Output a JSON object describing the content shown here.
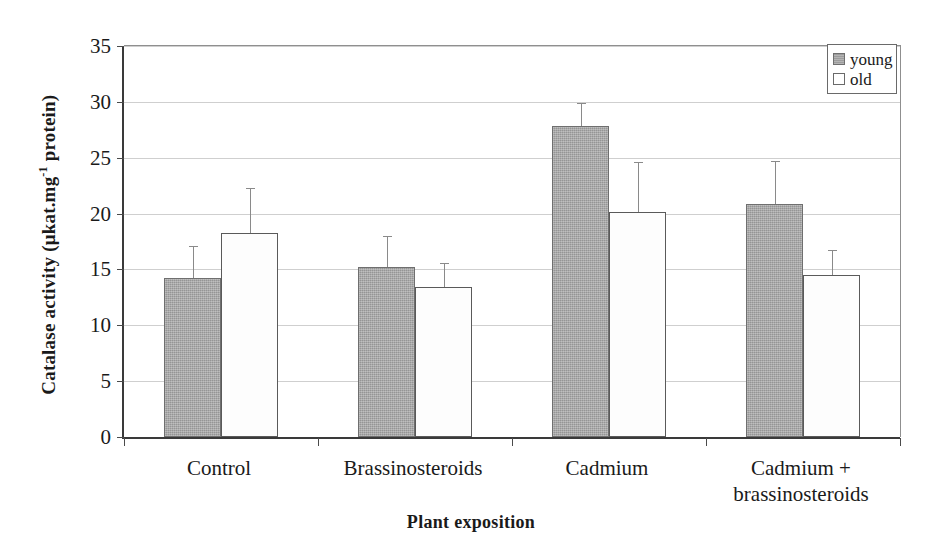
{
  "chart_data": {
    "type": "bar",
    "title": "",
    "xlabel": "Plant exposition",
    "ylabel": "Catalase activity (μkat.mg⁻¹ protein)",
    "ylabel_parts": {
      "prefix": "Catalase activity (μkat.mg",
      "superscript": "-1",
      "suffix": " protein)"
    },
    "categories": [
      "Control",
      "Brassinosteroids",
      "Cadmium",
      "Cadmium +\nbrassinosteroids"
    ],
    "series": [
      {
        "name": "young",
        "values": [
          14.2,
          15.2,
          27.8,
          20.9
        ],
        "errors": [
          2.9,
          2.8,
          2.1,
          3.8
        ],
        "fill": "#a6a6a6"
      },
      {
        "name": "old",
        "values": [
          18.3,
          13.4,
          20.1,
          14.5
        ],
        "errors": [
          4.0,
          2.2,
          4.5,
          2.2
        ],
        "fill": "#ffffff"
      }
    ],
    "ylim": [
      0,
      35
    ],
    "yticks": [
      0,
      5,
      10,
      15,
      20,
      25,
      30,
      35
    ],
    "ytick_labels": [
      "0",
      "5",
      "10",
      "15",
      "20",
      "25",
      "30",
      "35"
    ],
    "grid": true,
    "grid_axis": "y",
    "legend_position": "top-right",
    "error_bar_style": "upper-only",
    "axis_color": "#3a3a3a",
    "grid_color": "#cfcfcf"
  },
  "legend": {
    "entries": [
      {
        "label": "young",
        "swatch": "young"
      },
      {
        "label": "old",
        "swatch": "old"
      }
    ]
  }
}
